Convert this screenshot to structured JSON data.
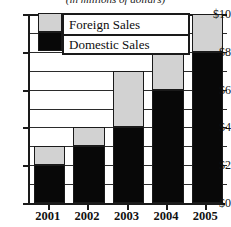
{
  "chart_data": {
    "type": "bar",
    "subtype": "stacked",
    "title": "",
    "subtitle": "(in millions of dollars)",
    "xlabel": "",
    "ylabel": "",
    "categories": [
      "2001",
      "2002",
      "2003",
      "2004",
      "2005"
    ],
    "series": [
      {
        "name": "Domestic Sales",
        "color": "#080808",
        "values": [
          2,
          3,
          4,
          6,
          8
        ]
      },
      {
        "name": "Foreign Sales",
        "color": "#d2d2d2",
        "values": [
          1,
          1,
          3,
          2,
          2
        ]
      }
    ],
    "totals": [
      3,
      4,
      7,
      8,
      10
    ],
    "ylim": [
      0,
      10
    ],
    "ytick_values": [
      0,
      2,
      4,
      6,
      8,
      10
    ],
    "ytick_labels": [
      "$0",
      "$2",
      "$4",
      "$6",
      "$8",
      "$10"
    ],
    "gridlines": [
      1,
      2,
      3,
      4,
      5,
      6,
      7,
      8,
      9,
      10
    ],
    "grid": true,
    "legend_position": "top-center",
    "legend_entries": [
      {
        "label": "Foreign Sales",
        "color": "#d2d2d2"
      },
      {
        "label": "Domestic Sales",
        "color": "#080808"
      }
    ]
  }
}
